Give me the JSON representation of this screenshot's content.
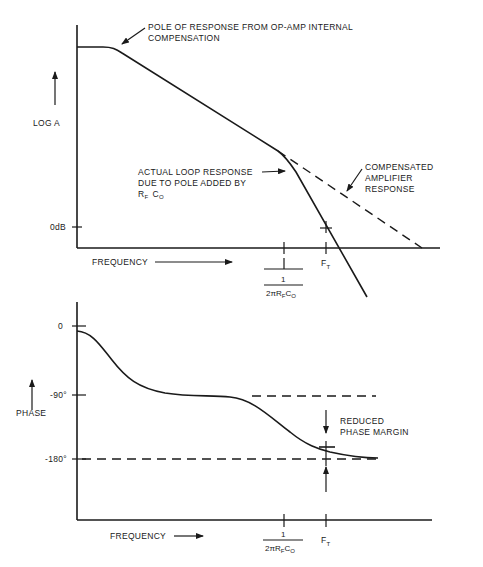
{
  "top_plot": {
    "y_label": "LOG A",
    "y_tick_0db": "0dB",
    "x_label": "FREQUENCY",
    "annotation_pole": [
      "POLE OF RESPONSE FROM OP-AMP INTERNAL",
      "COMPENSATION"
    ],
    "annotation_actual": [
      "ACTUAL LOOP RESPONSE",
      "DUE TO POLE ADDED BY"
    ],
    "annotation_actual_rf": "R",
    "annotation_actual_rf_sub": "F",
    "annotation_actual_co": "C",
    "annotation_actual_co_sub": "O",
    "annotation_compensated": [
      "COMPENSATED",
      "AMPLIFIER",
      "RESPONSE"
    ],
    "tick_ft": "F",
    "tick_ft_sub": "T",
    "tick_pole_num": "1",
    "tick_pole_den": "2πR",
    "tick_pole_den_sub1": "F",
    "tick_pole_den_c": "C",
    "tick_pole_den_sub2": "O"
  },
  "bottom_plot": {
    "y_label": "PHASE",
    "y_ticks": [
      "0",
      "-90°",
      "-180°"
    ],
    "x_label": "FREQUENCY",
    "annotation_margin": [
      "REDUCED",
      "PHASE MARGIN"
    ],
    "tick_ft": "F",
    "tick_ft_sub": "T",
    "tick_pole_num": "1",
    "tick_pole_den": "2πR",
    "tick_pole_den_sub1": "F",
    "tick_pole_den_c": "C",
    "tick_pole_den_sub2": "O"
  }
}
